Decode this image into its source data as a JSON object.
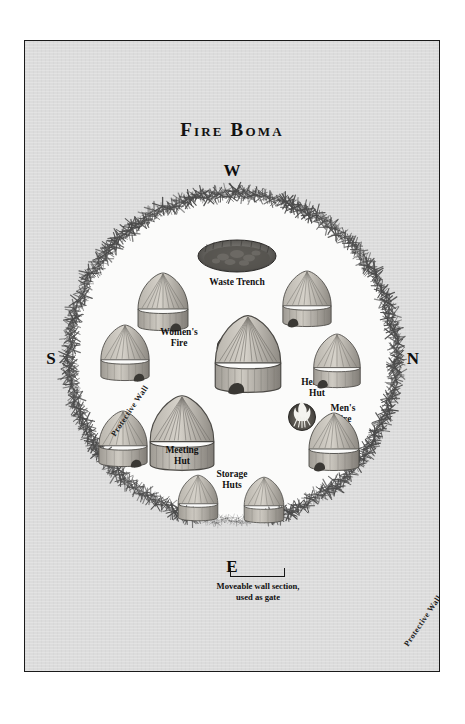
{
  "plate": {
    "title": "Fire Boma",
    "background_color": "#dcdcdc",
    "border_color": "#1a1a1a",
    "ground_color": "#fbfbfa"
  },
  "compass": {
    "top": "W",
    "bottom": "E",
    "left": "S",
    "right": "N"
  },
  "wall": {
    "label_upper_left": "Protective Wall",
    "label_lower_right": "Protective Wall",
    "gate_label": "Moveable wall section,\nused as gate"
  },
  "features": [
    {
      "name": "waste-trench",
      "label": "Waste Trench",
      "type": "pit"
    },
    {
      "name": "womens-fire",
      "label": "Women's\nFire",
      "type": "fire"
    },
    {
      "name": "mens-fire",
      "label": "Men's\nFire",
      "type": "fire"
    },
    {
      "name": "healing-hut",
      "label": "Healing\nHut",
      "type": "hut"
    },
    {
      "name": "meeting-hut",
      "label": "Meeting\nHut",
      "type": "hut"
    },
    {
      "name": "storage-huts",
      "label": "Storage\nHuts",
      "type": "hut"
    }
  ],
  "labels": {
    "waste_trench": "Waste Trench",
    "womens_fire": "Women's\nFire",
    "mens_fire": "Men's\nFire",
    "healing_hut": "Healing\nHut",
    "meeting_hut": "Meeting\nHut",
    "storage_huts": "Storage\nHuts"
  }
}
